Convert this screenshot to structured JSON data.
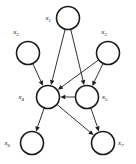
{
  "diagram": {
    "type": "directed-graph",
    "background_color": "#ffffff",
    "stroke_color": "#1b1b1b",
    "node_fill_color": "#ffffff",
    "node_radius": 11.5,
    "canvas": {
      "width": 136,
      "height": 164
    },
    "nodes": [
      {
        "id": "x1",
        "label_base": "x",
        "label_sub": "1",
        "label_full": "x1",
        "cx": 68,
        "cy": 18,
        "label_x": 51,
        "label_y": 20,
        "label_position": "left"
      },
      {
        "id": "x2",
        "label_base": "x",
        "label_sub": "2",
        "label_full": "x2",
        "cx": 28,
        "cy": 53,
        "label_x": 16,
        "label_y": 34,
        "label_position": "above-left"
      },
      {
        "id": "x3",
        "label_base": "x",
        "label_sub": "3",
        "label_full": "x3",
        "cx": 108,
        "cy": 53,
        "label_x": 104,
        "label_y": 34,
        "label_position": "above-right"
      },
      {
        "id": "x4",
        "label_base": "x",
        "label_sub": "4",
        "label_full": "x4",
        "cx": 48,
        "cy": 97,
        "label_x": 24,
        "label_y": 99,
        "label_position": "left"
      },
      {
        "id": "x5",
        "label_base": "x",
        "label_sub": "5",
        "label_full": "x5",
        "cx": 87,
        "cy": 97,
        "label_x": 102,
        "label_y": 99,
        "label_position": "right"
      },
      {
        "id": "x6",
        "label_base": "x",
        "label_sub": "6",
        "label_full": "x6",
        "cx": 32,
        "cy": 143,
        "label_x": 10,
        "label_y": 145,
        "label_position": "left"
      },
      {
        "id": "x7",
        "label_base": "x",
        "label_sub": "7",
        "label_full": "x7",
        "cx": 103,
        "cy": 143,
        "label_x": 118,
        "label_y": 145,
        "label_position": "right"
      }
    ],
    "edges": [
      {
        "id": "e1",
        "from": "x1",
        "to": "x4",
        "arrowhead": true
      },
      {
        "id": "e2",
        "from": "x1",
        "to": "x5",
        "arrowhead": true
      },
      {
        "id": "e3",
        "from": "x2",
        "to": "x4",
        "arrowhead": true
      },
      {
        "id": "e4",
        "from": "x3",
        "to": "x4",
        "arrowhead": true
      },
      {
        "id": "e5",
        "from": "x3",
        "to": "x5",
        "arrowhead": true
      },
      {
        "id": "e6",
        "from": "x5",
        "to": "x4",
        "arrowhead": true
      },
      {
        "id": "e7",
        "from": "x4",
        "to": "x6",
        "arrowhead": true
      },
      {
        "id": "e8",
        "from": "x4",
        "to": "x7",
        "arrowhead": true
      },
      {
        "id": "e9",
        "from": "x5",
        "to": "x7",
        "arrowhead": true
      }
    ]
  }
}
